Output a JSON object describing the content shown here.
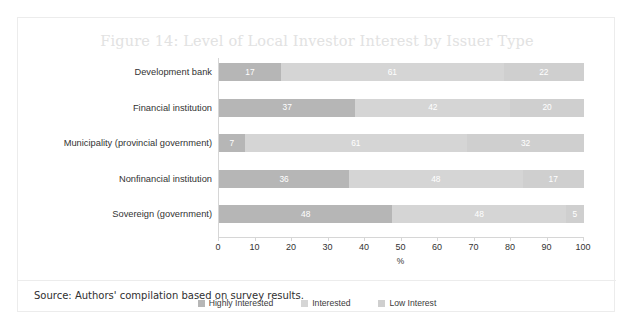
{
  "figure": {
    "title": "Figure 14: Level of Local Investor Interest by Issuer Type",
    "source": "Source: Authors' compilation based on survey results."
  },
  "chart_data": {
    "type": "bar",
    "orientation": "horizontal",
    "stacked": true,
    "normalized_percent": true,
    "title": "Figure 14: Level of Local Investor Interest by Issuer Type",
    "xlabel": "%",
    "ylabel": "",
    "xlim": [
      0,
      100
    ],
    "xticks": [
      0,
      10,
      20,
      30,
      40,
      50,
      60,
      70,
      80,
      90,
      100
    ],
    "xtick_labels": [
      "0",
      "10",
      "20",
      "30",
      "40",
      "50",
      "60",
      "70",
      "80",
      "90",
      "100"
    ],
    "grid": false,
    "legend_position": "bottom-center",
    "categories": [
      "Development bank",
      "Financial institution",
      "Municipality (provincial government)",
      "Nonfinancial institution",
      "Sovereign (government)"
    ],
    "series": [
      {
        "name": "Highly Interested",
        "color": "#b6b6b6",
        "values": [
          17,
          37,
          7,
          36,
          48
        ]
      },
      {
        "name": "Interested",
        "color": "#d5d5d5",
        "values": [
          61,
          42,
          61,
          48,
          48
        ]
      },
      {
        "name": "Low Interest",
        "color": "#cfcfcf",
        "values": [
          22,
          20,
          32,
          17,
          5
        ]
      }
    ]
  },
  "colors": {
    "highly_interested": "#b6b6b6",
    "interested": "#d5d5d5",
    "low_interest": "#cfcfcf",
    "axis": "#d6d6d6",
    "title_text": "#e2e2e2",
    "body_text": "#333333",
    "frame_border": "#ececec"
  }
}
